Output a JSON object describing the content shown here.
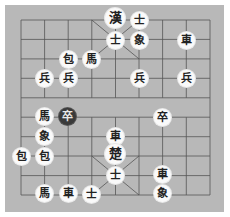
{
  "board": {
    "columns": 9,
    "rows": 10,
    "grid_x": [
      21,
      44.6,
      68.2,
      91.8,
      115.5,
      139,
      162.6,
      186.3,
      210
    ],
    "grid_y": [
      20,
      39.4,
      58.9,
      78.3,
      97.8,
      117.2,
      136.7,
      156,
      175.6,
      195
    ],
    "background_color": "#b8b8b8",
    "line_color": "#555555"
  },
  "pieces": [
    {
      "char": "漢",
      "x": 115,
      "y": 18,
      "big": true,
      "dark": false
    },
    {
      "char": "士",
      "x": 139,
      "y": 20,
      "dark": false
    },
    {
      "char": "士",
      "x": 115,
      "y": 40,
      "dark": false
    },
    {
      "char": "象",
      "x": 139,
      "y": 40,
      "dark": false
    },
    {
      "char": "車",
      "x": 186,
      "y": 40,
      "dark": false
    },
    {
      "char": "包",
      "x": 68,
      "y": 59,
      "dark": false
    },
    {
      "char": "馬",
      "x": 91,
      "y": 59,
      "dark": false
    },
    {
      "char": "兵",
      "x": 44,
      "y": 78,
      "dark": false
    },
    {
      "char": "兵",
      "x": 68,
      "y": 78,
      "dark": false
    },
    {
      "char": "兵",
      "x": 139,
      "y": 78,
      "dark": false
    },
    {
      "char": "兵",
      "x": 186,
      "y": 78,
      "dark": false
    },
    {
      "char": "馬",
      "x": 44,
      "y": 116,
      "dark": false
    },
    {
      "char": "卒",
      "x": 67,
      "y": 116,
      "dark": true
    },
    {
      "char": "卒",
      "x": 162,
      "y": 117,
      "dark": false
    },
    {
      "char": "象",
      "x": 44,
      "y": 136,
      "dark": false
    },
    {
      "char": "車",
      "x": 115,
      "y": 136,
      "dark": false
    },
    {
      "char": "包",
      "x": 21,
      "y": 156,
      "dark": false
    },
    {
      "char": "包",
      "x": 44,
      "y": 156,
      "dark": false
    },
    {
      "char": "楚",
      "x": 115,
      "y": 154,
      "big": true,
      "dark": false
    },
    {
      "char": "士",
      "x": 115,
      "y": 175,
      "dark": false
    },
    {
      "char": "車",
      "x": 162,
      "y": 174,
      "dark": false
    },
    {
      "char": "馬",
      "x": 44,
      "y": 193,
      "dark": false
    },
    {
      "char": "車",
      "x": 68,
      "y": 193,
      "dark": false
    },
    {
      "char": "士",
      "x": 91,
      "y": 194,
      "dark": false
    },
    {
      "char": "象",
      "x": 162,
      "y": 193,
      "dark": false
    }
  ]
}
